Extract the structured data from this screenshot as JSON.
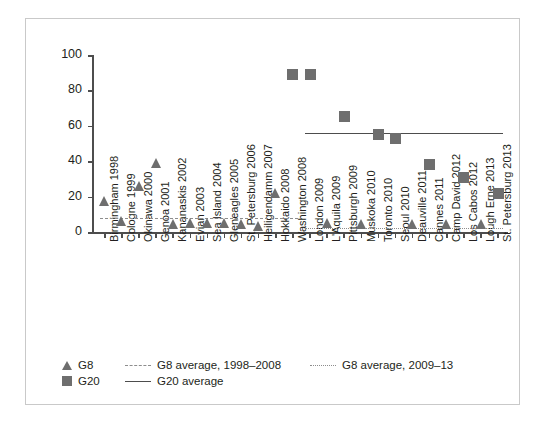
{
  "chart_data": {
    "type": "scatter",
    "title": "",
    "xlabel": "",
    "ylabel": "",
    "ylim": [
      0,
      100
    ],
    "ytick_labels": [
      "0",
      "20",
      "40",
      "60",
      "80",
      "100"
    ],
    "ytick_values": [
      0,
      20,
      40,
      60,
      80,
      100
    ],
    "grid": false,
    "legend_position": "bottom-left",
    "categories": [
      "Birmingham 1998",
      "Cologne 1999",
      "Okinawa 2000",
      "Genoa 2001",
      "Kananaskis 2002",
      "Evian 2003",
      "Sea Island 2004",
      "Gleneagles 2005",
      "St. Petersburg 2006",
      "Heiligendamm 2007",
      "Hokkaido 2008",
      "Washington 2008",
      "London 2009",
      "L'Aquila 2009",
      "Pittsburgh 2009",
      "Muskoka 2010",
      "Toronto 2010",
      "Seoul 2010",
      "Deauville 2011",
      "Cannes 2011",
      "Camp David 2012",
      "Los Cabos 2012",
      "Lough Erne 2013",
      "St. Petersburg 2013"
    ],
    "series": [
      {
        "name": "G8",
        "marker": "triangle",
        "color": "#6e6e6e",
        "points": [
          {
            "category": "Birmingham 1998",
            "value": 15
          },
          {
            "category": "Cologne 1999",
            "value": 4
          },
          {
            "category": "Okinawa 2000",
            "value": 24
          },
          {
            "category": "Genoa 2001",
            "value": 37
          },
          {
            "category": "Kananaskis 2002",
            "value": 2
          },
          {
            "category": "Evian 2003",
            "value": 3
          },
          {
            "category": "Sea Island 2004",
            "value": 3
          },
          {
            "category": "Gleneagles 2005",
            "value": 3
          },
          {
            "category": "St. Petersburg 2006",
            "value": 2
          },
          {
            "category": "Heiligendamm 2007",
            "value": 1
          },
          {
            "category": "Hokkaido 2008",
            "value": 20
          },
          {
            "category": "L'Aquila 2009",
            "value": 3
          },
          {
            "category": "Muskoka 2010",
            "value": 2
          },
          {
            "category": "Deauville 2011",
            "value": 2
          },
          {
            "category": "Camp David 2012",
            "value": 2
          },
          {
            "category": "Lough Erne 2013",
            "value": 2
          }
        ]
      },
      {
        "name": "G20",
        "marker": "square",
        "color": "#6e6e6e",
        "points": [
          {
            "category": "Washington 2008",
            "value": 89
          },
          {
            "category": "London 2009",
            "value": 89
          },
          {
            "category": "Pittsburgh 2009",
            "value": 65
          },
          {
            "category": "Toronto 2010",
            "value": 55
          },
          {
            "category": "Seoul 2010",
            "value": 53
          },
          {
            "category": "Cannes 2011",
            "value": 38
          },
          {
            "category": "Los Cabos 2012",
            "value": 31
          },
          {
            "category": "St. Petersburg 2013",
            "value": 22
          }
        ]
      }
    ],
    "reference_lines": [
      {
        "name": "G8 average, 1998–2008",
        "value": 8,
        "style": "dashed",
        "color": "#8d8d8d",
        "x_start_category": "Birmingham 1998",
        "x_end_category": "Washington 2008"
      },
      {
        "name": "G8 average, 2009–13",
        "value": 2,
        "style": "dotted",
        "color": "#8d8d8d",
        "x_start_category": "London 2009",
        "x_end_category": "St. Petersburg 2013"
      },
      {
        "name": "G20 average",
        "value": 56,
        "style": "solid",
        "color": "#4d4d4d",
        "x_start_category": "London 2009",
        "x_end_category": "St. Petersburg 2013"
      }
    ],
    "legend": [
      {
        "label": "G8",
        "swatch": "triangle"
      },
      {
        "label": "G8 average, 1998–2008",
        "swatch": "dashed-line"
      },
      {
        "label": "G8 average, 2009–13",
        "swatch": "dotted-line"
      },
      {
        "label": "G20",
        "swatch": "square"
      },
      {
        "label": "G20 average",
        "swatch": "solid-line"
      }
    ]
  }
}
